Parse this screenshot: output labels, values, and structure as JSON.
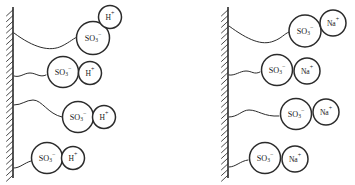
{
  "figure": {
    "background_color": "#ffffff",
    "stroke_color": "#2b2b2b",
    "panels": [
      {
        "id": "left-panel",
        "name": "acid-form-panel",
        "wall": {
          "name": "substrate-wall-left",
          "x": 13,
          "y_top": 7,
          "y_bottom": 178,
          "hatch_side": "left",
          "hatch_count": 30
        },
        "chains": [
          {
            "name": "polymer-chain-1",
            "path": "M 14 33 C 34 48, 50 52, 62 46 C 70 42, 74 38, 79 36"
          },
          {
            "name": "polymer-chain-2",
            "path": "M 14 76 C 20 78, 24 73, 30 73 C 36 73, 40 78, 46 75"
          },
          {
            "name": "polymer-chain-3",
            "path": "M 14 105 C 22 105, 26 100, 33 100 C 42 100, 48 114, 62 117"
          },
          {
            "name": "polymer-chain-4",
            "path": "M 14 168 C 20 168, 24 163, 31 161"
          }
        ],
        "groups": [
          {
            "anion": {
              "name": "sulfonate-group",
              "cx": 93,
              "cy": 38,
              "r": 16.5,
              "main": "SO",
              "sub": "3",
              "sup": "−"
            },
            "cation": {
              "name": "hydrogen-ion",
              "cx": 110,
              "cy": 17,
              "r": 11.5,
              "main": "H",
              "sup": "+"
            }
          },
          {
            "anion": {
              "name": "sulfonate-group",
              "cx": 63,
              "cy": 72,
              "r": 15.5,
              "main": "SO",
              "sub": "3",
              "sup": "−"
            },
            "cation": {
              "name": "hydrogen-ion",
              "cx": 90,
              "cy": 73,
              "r": 11.5,
              "main": "H",
              "sup": "+"
            }
          },
          {
            "anion": {
              "name": "sulfonate-group",
              "cx": 78,
              "cy": 117,
              "r": 15.5,
              "main": "SO",
              "sub": "3",
              "sup": "−"
            },
            "cation": {
              "name": "hydrogen-ion",
              "cx": 104,
              "cy": 117,
              "r": 11.5,
              "main": "H",
              "sup": "+"
            }
          },
          {
            "anion": {
              "name": "sulfonate-group",
              "cx": 47,
              "cy": 158,
              "r": 15.5,
              "main": "SO",
              "sub": "3",
              "sup": "−"
            },
            "cation": {
              "name": "hydrogen-ion",
              "cx": 73,
              "cy": 158,
              "r": 11.5,
              "main": "H",
              "sup": "+"
            }
          }
        ]
      },
      {
        "id": "right-panel",
        "name": "sodium-form-panel",
        "wall": {
          "name": "substrate-wall-right",
          "x": 228,
          "y_top": 7,
          "y_bottom": 178,
          "hatch_side": "left",
          "hatch_count": 30
        },
        "chains": [
          {
            "name": "polymer-chain-1",
            "path": "M 229 26 C 248 40, 262 46, 274 41 C 282 38, 284 34, 289 32"
          },
          {
            "name": "polymer-chain-2",
            "path": "M 229 75 C 235 76, 240 71, 246 71 C 252 71, 254 75, 260 72"
          },
          {
            "name": "polymer-chain-3",
            "path": "M 229 117 C 238 117, 242 110, 249 110 C 258 110, 264 117, 279 116"
          },
          {
            "name": "polymer-chain-4",
            "path": "M 229 167 C 236 167, 240 161, 248 160"
          }
        ],
        "groups": [
          {
            "anion": {
              "name": "sulfonate-group",
              "cx": 305,
              "cy": 31,
              "r": 16.0,
              "main": "SO",
              "sub": "3",
              "sup": "−"
            },
            "cation": {
              "name": "sodium-ion",
              "cx": 333,
              "cy": 23,
              "r": 13.0,
              "main": "Na",
              "sup": "+"
            }
          },
          {
            "anion": {
              "name": "sulfonate-group",
              "cx": 277,
              "cy": 70,
              "r": 15.5,
              "main": "SO",
              "sub": "3",
              "sup": "−"
            },
            "cation": {
              "name": "sodium-ion",
              "cx": 307,
              "cy": 71,
              "r": 13.0,
              "main": "Na",
              "sup": "+"
            }
          },
          {
            "anion": {
              "name": "sulfonate-group",
              "cx": 296,
              "cy": 114,
              "r": 15.5,
              "main": "SO",
              "sub": "3",
              "sup": "−"
            },
            "cation": {
              "name": "sodium-ion",
              "cx": 326,
              "cy": 112,
              "r": 13.0,
              "main": "Na",
              "sup": "+"
            }
          },
          {
            "anion": {
              "name": "sulfonate-group",
              "cx": 265,
              "cy": 158,
              "r": 15.5,
              "main": "SO",
              "sub": "3",
              "sup": "−"
            },
            "cation": {
              "name": "sodium-ion",
              "cx": 295,
              "cy": 159,
              "r": 13.0,
              "main": "Na",
              "sup": "+"
            }
          }
        ]
      }
    ]
  }
}
